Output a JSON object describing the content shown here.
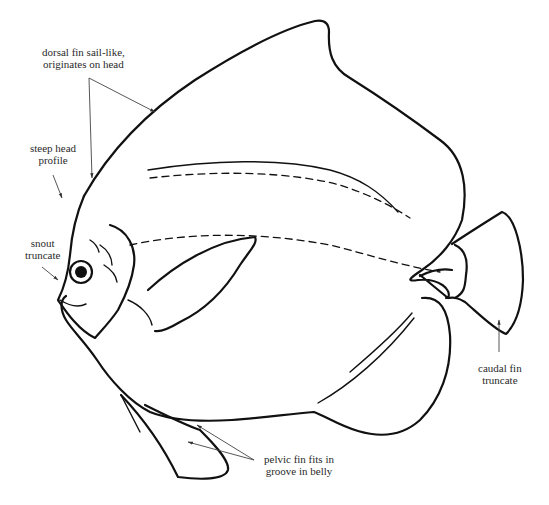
{
  "figure": {
    "labels": {
      "dorsal_fin": {
        "line1": "dorsal fin sail-like,",
        "line2": "originates on head"
      },
      "head_profile": {
        "line1": "steep head",
        "line2": "profile"
      },
      "snout": {
        "line1": "snout",
        "line2": "truncate"
      },
      "caudal_fin": {
        "line1": "caudal fin",
        "line2": "truncate"
      },
      "pelvic_fin": {
        "line1": "pelvic fin fits in",
        "line2": "groove in belly"
      }
    }
  }
}
